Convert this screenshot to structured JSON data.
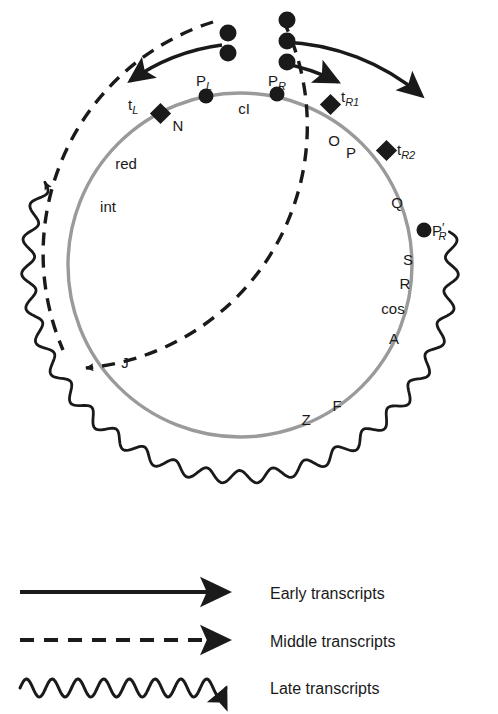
{
  "diagram": {
    "colors": {
      "genome_circle": "#9a9a9a",
      "ink": "#1a1a1a",
      "background": "#ffffff"
    },
    "genome_circle": {
      "name": "lambda-genome-circle",
      "center_x": 240,
      "center_y": 265,
      "radius": 172
    },
    "promoters": [
      {
        "id": "pl",
        "label": "P",
        "sub": "L",
        "x": 206,
        "y": 96,
        "label_x": 196,
        "label_y": 86
      },
      {
        "id": "pr",
        "label": "P",
        "sub": "R",
        "x": 277,
        "y": 94,
        "label_x": 268,
        "label_y": 86
      },
      {
        "id": "prp",
        "label": "P",
        "sub": "R",
        "prime": true,
        "x": 424,
        "y": 230,
        "label_x": 432,
        "label_y": 236
      }
    ],
    "terminators": [
      {
        "id": "tl",
        "label": "t",
        "sub": "L",
        "x": 161,
        "y": 114,
        "label_x": 128,
        "label_y": 110
      },
      {
        "id": "tr1",
        "label": "t",
        "sub": "R1",
        "x": 330,
        "y": 104,
        "label_x": 341,
        "label_y": 102
      },
      {
        "id": "tr2",
        "label": "t",
        "sub": "R2",
        "x": 386,
        "y": 150,
        "label_x": 397,
        "label_y": 155
      }
    ],
    "genes": [
      {
        "id": "n",
        "label": "N",
        "x": 178,
        "y": 131
      },
      {
        "id": "ci",
        "label": "cI",
        "x": 244,
        "y": 114
      },
      {
        "id": "o",
        "label": "O",
        "x": 334,
        "y": 146
      },
      {
        "id": "p",
        "label": "P",
        "x": 351,
        "y": 158
      },
      {
        "id": "q",
        "label": "Q",
        "x": 397,
        "y": 208
      },
      {
        "id": "s",
        "label": "S",
        "x": 408,
        "y": 265
      },
      {
        "id": "r",
        "label": "R",
        "x": 405,
        "y": 289
      },
      {
        "id": "cos",
        "label": "cos",
        "x": 393,
        "y": 314
      },
      {
        "id": "a",
        "label": "A",
        "x": 394,
        "y": 344
      },
      {
        "id": "f",
        "label": "F",
        "x": 337,
        "y": 411
      },
      {
        "id": "z",
        "label": "Z",
        "x": 306,
        "y": 425
      },
      {
        "id": "j",
        "label": "J",
        "x": 125,
        "y": 368
      },
      {
        "id": "int",
        "label": "int",
        "x": 108,
        "y": 212
      },
      {
        "id": "red",
        "label": "red",
        "x": 126,
        "y": 169
      }
    ],
    "transcripts": [
      {
        "id": "early",
        "style": "solid",
        "name": "early-transcript-arc"
      },
      {
        "id": "middle",
        "style": "dashed",
        "name": "middle-transcript-arc"
      },
      {
        "id": "late",
        "style": "wavy",
        "name": "late-transcript-arc"
      }
    ]
  },
  "legend": {
    "items": [
      {
        "id": "early",
        "style": "solid",
        "label": "Early transcripts"
      },
      {
        "id": "middle",
        "style": "dashed",
        "label": "Middle transcripts"
      },
      {
        "id": "late",
        "style": "wavy",
        "label": "Late transcripts"
      }
    ]
  }
}
